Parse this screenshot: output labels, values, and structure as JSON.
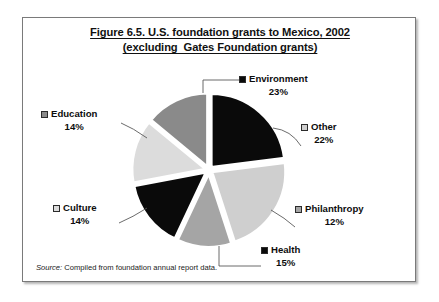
{
  "figure": {
    "title_line1": "Figure 6.5. U.S. foundation grants to Mexico, 2002",
    "title_line2": "(excluding  Gates Foundation grants)",
    "source_key": "Source:",
    "source_text": "Compiled from foundation annual report data."
  },
  "chart_data": {
    "type": "pie",
    "title": "Figure 6.5. U.S. foundation grants to Mexico, 2002 (excluding  Gates Foundation grants)",
    "subtitle": "",
    "xlabel": "",
    "ylabel": "",
    "legend_position": "labels-with-leader-lines",
    "grid": false,
    "exploded": true,
    "start_angle_deg": -90,
    "categories": [
      "Environment",
      "Other",
      "Philanthropy",
      "Health",
      "Culture",
      "Education"
    ],
    "values": [
      23,
      22,
      12,
      15,
      14,
      14
    ],
    "unit": "%",
    "colors": [
      "#0a0a0a",
      "#cfcfcf",
      "#a5a5a5",
      "#0a0a0a",
      "#dcdcdc",
      "#8a8a8a"
    ],
    "slices": [
      {
        "label": "Environment",
        "value": 23,
        "value_text": "23%",
        "color": "#0a0a0a",
        "swatch": "filled-black-square"
      },
      {
        "label": "Other",
        "value": 22,
        "value_text": "22%",
        "color": "#cfcfcf",
        "swatch": "light-grey-square"
      },
      {
        "label": "Philanthropy",
        "value": 12,
        "value_text": "12%",
        "color": "#a5a5a5",
        "swatch": "mid-grey-square"
      },
      {
        "label": "Health",
        "value": 15,
        "value_text": "15%",
        "color": "#0a0a0a",
        "swatch": "filled-black-square"
      },
      {
        "label": "Culture",
        "value": 14,
        "value_text": "14%",
        "color": "#dcdcdc",
        "swatch": "light-grey-square"
      },
      {
        "label": "Education",
        "value": 14,
        "value_text": "14%",
        "color": "#8a8a8a",
        "swatch": "dark-grey-square"
      }
    ]
  }
}
